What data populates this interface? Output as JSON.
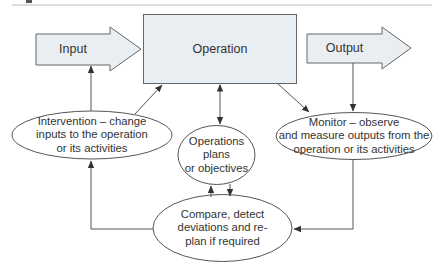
{
  "diagram": {
    "colors": {
      "box_fill": "#e9eef3",
      "stroke": "#555555",
      "text": "#333333",
      "rule": "#bbbbbb"
    },
    "nodes": {
      "input": {
        "label": "Input",
        "shape": "block-arrow"
      },
      "operation": {
        "label": "Operation",
        "shape": "rectangle"
      },
      "output": {
        "label": "Output",
        "shape": "block-arrow"
      },
      "intervention": {
        "label": "Intervention – change inputs to the operation or its activities",
        "lines": [
          "Intervention – change",
          "inputs to the operation",
          "or its activities"
        ],
        "shape": "ellipse"
      },
      "plans": {
        "label": "Operations plans or objectives",
        "lines": [
          "Operations",
          "plans",
          "or objectives"
        ],
        "shape": "ellipse"
      },
      "monitor": {
        "label": "Monitor – observe and measure outputs from the operation or its activities",
        "lines": [
          "Monitor – observe",
          "and measure outputs from the",
          "operation or its activities"
        ],
        "shape": "ellipse"
      },
      "compare": {
        "label": "Compare, detect deviations and re-plan if required",
        "lines": [
          "Compare, detect",
          "deviations and re-",
          "plan if required"
        ],
        "shape": "ellipse"
      }
    },
    "edges": [
      {
        "from": "input",
        "to": "operation",
        "type": "flow"
      },
      {
        "from": "operation",
        "to": "output",
        "type": "flow"
      },
      {
        "from": "intervention",
        "to": "input"
      },
      {
        "from": "intervention",
        "to": "operation"
      },
      {
        "from": "operation",
        "to": "plans",
        "bidirectional": true
      },
      {
        "from": "operation",
        "to": "monitor"
      },
      {
        "from": "output",
        "to": "monitor"
      },
      {
        "from": "monitor",
        "to": "compare"
      },
      {
        "from": "compare",
        "to": "plans"
      },
      {
        "from": "plans",
        "to": "compare"
      },
      {
        "from": "compare",
        "to": "intervention"
      }
    ]
  }
}
